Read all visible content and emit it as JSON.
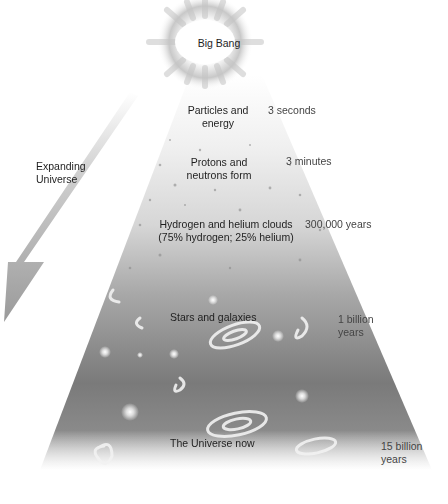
{
  "diagram": {
    "title": "Big Bang",
    "arrow_label": [
      "Expanding",
      "Universe"
    ],
    "stages": [
      {
        "label": [
          "Particles and",
          "energy"
        ],
        "time": [
          "3 seconds"
        ]
      },
      {
        "label": [
          "Protons and",
          "neutrons form"
        ],
        "time": [
          "3 minutes"
        ]
      },
      {
        "label": [
          "Hydrogen and helium clouds",
          "(75% hydrogen; 25% helium)"
        ],
        "time": [
          "300,000 years"
        ]
      },
      {
        "label": [
          "Stars and galaxies"
        ],
        "time": [
          "1 billion",
          "years"
        ]
      },
      {
        "label": [
          "The Universe now"
        ],
        "time": [
          "15 billion",
          "years"
        ]
      }
    ],
    "colors": {
      "background": "#ffffff",
      "cone_top": "#f4f4f4",
      "cone_bottom": "#6e6e6e",
      "arrow": "#a8a8a8",
      "burst": "#b8b8b8"
    }
  }
}
